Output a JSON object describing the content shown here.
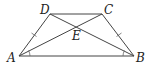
{
  "diagram": {
    "type": "isosceles-trapezoid",
    "points": {
      "A": {
        "label": "A",
        "x": 19,
        "y": 56
      },
      "B": {
        "label": "B",
        "x": 134,
        "y": 56
      },
      "C": {
        "label": "C",
        "x": 102,
        "y": 14
      },
      "D": {
        "label": "D",
        "x": 50,
        "y": 14
      },
      "E": {
        "label": "E",
        "x": 76.5,
        "y": 27
      }
    },
    "segments": [
      "AB",
      "BC",
      "CD",
      "DA",
      "AC",
      "BD"
    ],
    "equal_marks": [
      "AD",
      "BC"
    ],
    "angle_marks": [
      "A",
      "B"
    ],
    "stroke_color": "#444444",
    "label_color": "#222222"
  }
}
